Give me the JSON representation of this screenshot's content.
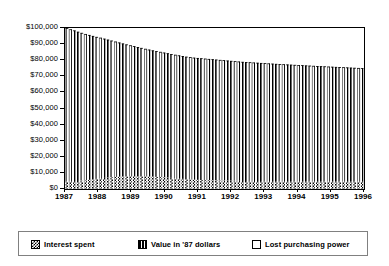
{
  "chart_data": {
    "type": "bar",
    "title": "",
    "subtitle": "",
    "xlabel": "",
    "ylabel": "",
    "stacked": true,
    "grid": false,
    "legend_position": "bottom",
    "ylim": [
      0,
      100000
    ],
    "xlim": [
      1987,
      1996
    ],
    "y_tick_labels": [
      "$100,000",
      "$90,000",
      "$80,000",
      "$70,000",
      "$60,000",
      "$50,000",
      "$40,000",
      "$30,000",
      "$20,000",
      "$10,000",
      "$0"
    ],
    "y_tick_values": [
      100000,
      90000,
      80000,
      70000,
      60000,
      50000,
      40000,
      30000,
      20000,
      10000,
      0
    ],
    "x_tick_labels": [
      "1987",
      "1988",
      "1989",
      "1990",
      "1991",
      "1992",
      "1993",
      "1994",
      "1995",
      "1996"
    ],
    "x_tick_values": [
      1987,
      1988,
      1989,
      1990,
      1991,
      1992,
      1993,
      1994,
      1995,
      1996
    ],
    "legend": [
      {
        "label": "Interest spent",
        "pattern": "checkerboard"
      },
      {
        "label": "Value in '87 dollars",
        "pattern": "vertical-stripes"
      },
      {
        "label": "Lost purchasing power",
        "pattern": "white"
      }
    ],
    "series": [
      {
        "name": "Interest spent",
        "pattern": "checkerboard",
        "values": [
          4700,
          4800,
          4900,
          5000,
          5200,
          5400,
          5700,
          6000,
          6300,
          6600,
          6900,
          7100,
          7300,
          7500,
          7700,
          7800,
          7900,
          7950,
          8000,
          8000,
          7950,
          7900,
          7800,
          7700,
          7550,
          7400,
          7250,
          7100,
          6900,
          6700,
          6500,
          6300,
          6100,
          5950,
          5800,
          5700,
          5600,
          5500,
          5450,
          5400,
          5350,
          5300,
          5250,
          5200,
          5150,
          5100,
          5050,
          5000,
          4980,
          4960,
          4940,
          4920,
          4900,
          4880,
          4860,
          4840,
          4820,
          4800,
          4790,
          4780,
          4770,
          4760,
          4750,
          4740,
          4730,
          4720,
          4710,
          4700,
          4690,
          4680,
          4670,
          4660,
          4650,
          4640,
          4630,
          4620,
          4610,
          4600,
          4590,
          4580
        ]
      },
      {
        "name": "Value in '87 dollars",
        "pattern": "vertical-stripes",
        "values": [
          95300,
          94400,
          93600,
          92700,
          91800,
          90900,
          90000,
          89100,
          88200,
          87400,
          86500,
          85700,
          84900,
          84100,
          83300,
          82600,
          81900,
          81300,
          80700,
          80200,
          79700,
          79200,
          78800,
          78400,
          78100,
          77800,
          77500,
          77200,
          76900,
          76700,
          76500,
          76300,
          76100,
          75950,
          75800,
          75700,
          75600,
          75500,
          75350,
          75200,
          75050,
          74900,
          74750,
          74600,
          74450,
          74300,
          74150,
          74000,
          73880,
          73760,
          73640,
          73520,
          73400,
          73280,
          73160,
          73040,
          72920,
          72800,
          72690,
          72580,
          72470,
          72360,
          72250,
          72140,
          72030,
          71920,
          71810,
          71700,
          71600,
          71500,
          71400,
          71300,
          71200,
          71100,
          71000,
          70900,
          70800,
          70700,
          70600,
          70500
        ]
      },
      {
        "name": "Lost purchasing power",
        "pattern": "white",
        "values": [
          0,
          800,
          1500,
          2300,
          3000,
          3700,
          4300,
          4900,
          5500,
          6000,
          6600,
          7200,
          7800,
          8400,
          9000,
          9600,
          10200,
          10750,
          11300,
          11800,
          12350,
          12900,
          13400,
          13900,
          14350,
          14800,
          15250,
          15700,
          16200,
          16600,
          17000,
          17400,
          17800,
          18100,
          18400,
          18600,
          18800,
          19000,
          19200,
          19400,
          19600,
          19800,
          20000,
          20200,
          20400,
          20600,
          20800,
          21000,
          21140,
          21280,
          21420,
          21560,
          21700,
          21840,
          21980,
          22120,
          22260,
          22400,
          22520,
          22640,
          22760,
          22880,
          23000,
          23120,
          23240,
          23360,
          23480,
          23600,
          23710,
          23820,
          23930,
          24040,
          24150,
          24260,
          24370,
          24480,
          24590,
          24700,
          24810,
          24920
        ]
      }
    ],
    "total_top_values": [
      100000,
      100000,
      100000,
      100000,
      100000,
      100000,
      100000,
      100000,
      100000,
      100000,
      100000,
      100000,
      100000,
      100000,
      100000,
      100000,
      100000,
      100000,
      100000,
      100000,
      100000,
      100000,
      100000,
      100000,
      100000,
      100000,
      100000,
      100000,
      100000,
      100000,
      100000,
      100000,
      100000,
      100000,
      100000,
      100000,
      100000,
      100000,
      100000,
      100000,
      100000,
      100000,
      100000,
      100000,
      100000,
      100000,
      100000,
      100000,
      100000,
      100000,
      100000,
      100000,
      100000,
      100000,
      100000,
      100000,
      100000,
      100000,
      100000,
      100000,
      100000,
      100000,
      100000,
      100000,
      100000,
      100000,
      100000,
      100000,
      100000,
      100000,
      100000,
      100000,
      100000,
      100000,
      100000,
      100000,
      100000,
      100000,
      100000,
      100000
    ]
  },
  "colors": {
    "ink": "#000000",
    "background": "#ffffff",
    "frame": "#000000",
    "legend_border": "#808080"
  }
}
